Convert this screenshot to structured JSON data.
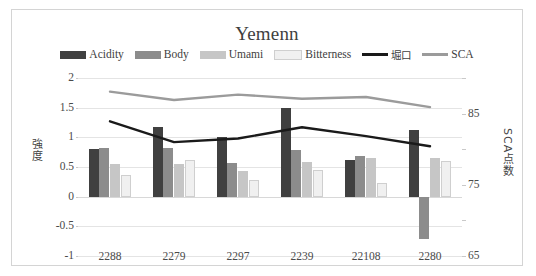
{
  "chart_data": {
    "type": "bar",
    "title": "Yemenn",
    "xlabel": "",
    "ylabel": "強度",
    "ylabel_secondary": "SCA点数",
    "categories": [
      "2288",
      "2279",
      "2297",
      "2239",
      "22108",
      "2280"
    ],
    "ylim": [
      -1,
      2
    ],
    "yticks": [
      "2",
      "1.5",
      "1",
      "0.5",
      "0",
      "-0.5",
      "-1"
    ],
    "ylim_secondary": [
      65,
      90
    ],
    "yticks_secondary": [
      "85",
      "75",
      "65"
    ],
    "yticks_secondary_all": [
      "90",
      "85",
      "80",
      "75",
      "70",
      "65"
    ],
    "grid": true,
    "legend_position": "top",
    "series": [
      {
        "name": "Acidity",
        "kind": "bar",
        "axis": "left",
        "color": "#404040",
        "values": [
          0.8,
          1.18,
          1.0,
          1.5,
          0.62,
          1.13
        ]
      },
      {
        "name": "Body",
        "kind": "bar",
        "axis": "left",
        "color": "#8c8c8c",
        "values": [
          0.82,
          0.82,
          0.57,
          0.78,
          0.68,
          -0.72
        ]
      },
      {
        "name": "Umami",
        "kind": "bar",
        "axis": "left",
        "color": "#c6c6c6",
        "values": [
          0.55,
          0.55,
          0.44,
          0.58,
          0.65,
          0.65
        ]
      },
      {
        "name": "Bitterness",
        "kind": "bar",
        "axis": "left",
        "color": "#f0f0f0",
        "border": "#cfcfcf",
        "values": [
          0.37,
          0.62,
          0.28,
          0.45,
          0.23,
          0.6
        ]
      },
      {
        "name": "堀口",
        "kind": "line",
        "axis": "left",
        "color": "#1a1a1a",
        "values": [
          1.27,
          0.92,
          0.98,
          1.17,
          1.02,
          0.85
        ]
      },
      {
        "name": "SCA",
        "kind": "line",
        "axis": "left",
        "color": "#9b9b9b",
        "values": [
          1.77,
          1.63,
          1.72,
          1.65,
          1.68,
          1.51
        ]
      }
    ]
  },
  "colors": {
    "frame": "#d4d4d4",
    "grid": "#e4e4e4",
    "text": "#4a4a4a",
    "background": "#ffffff"
  }
}
